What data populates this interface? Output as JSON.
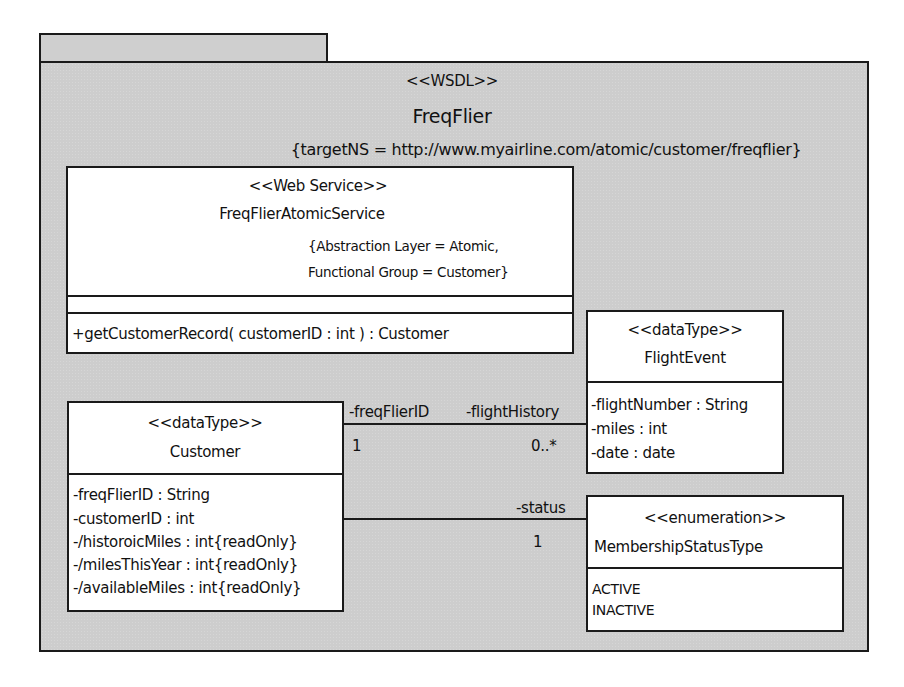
{
  "package": {
    "stereotype": "<<WSDL>>",
    "name": "FreqFlier",
    "tagged_value": "{targetNS = http://www.myairline.com/atomic/customer/freqflier}"
  },
  "web_service": {
    "stereotype": "<<Web Service>>",
    "name": "FreqFlierAtomicService",
    "tags": [
      "{Abstraction Layer = Atomic,",
      "Functional Group = Customer}"
    ],
    "operations": [
      "+getCustomerRecord( customerID : int ) : Customer"
    ]
  },
  "flight_event": {
    "stereotype": "<<dataType>>",
    "name": "FlightEvent",
    "attributes": [
      "-flightNumber : String",
      "-miles : int",
      "-date : date"
    ]
  },
  "customer": {
    "stereotype": "<<dataType>>",
    "name": "Customer",
    "attributes": [
      "-freqFlierID : String",
      "-customerID : int",
      "-/historoicMiles : int{readOnly}",
      "-/milesThisYear : int{readOnly}",
      "-/availableMiles : int{readOnly}"
    ]
  },
  "membership_status": {
    "stereotype": "<<enumeration>>",
    "name": "MembershipStatusType",
    "literals": [
      "ACTIVE",
      "INACTIVE"
    ]
  },
  "associations": {
    "flight_history": {
      "source_role": "-freqFlierID",
      "source_multiplicity": "1",
      "target_role": "-flightHistory",
      "target_multiplicity": "0..*"
    },
    "status": {
      "target_role": "-status",
      "target_multiplicity": "1"
    }
  }
}
